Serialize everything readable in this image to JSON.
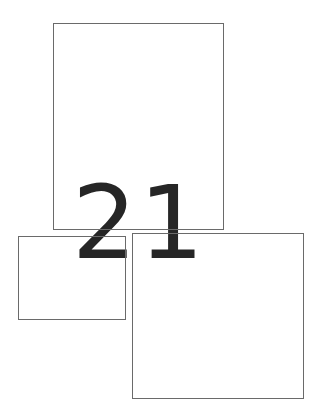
{
  "diagram": {
    "label": "21",
    "line_color": "#6a6a6a",
    "text_color": "#262626",
    "background": "#ffffff",
    "boxes": [
      {
        "id": "top-box",
        "x": 53,
        "y": 23,
        "width": 171,
        "height": 207
      },
      {
        "id": "bottom-left-box",
        "x": 18,
        "y": 236,
        "width": 108,
        "height": 84
      },
      {
        "id": "bottom-right-box",
        "x": 132,
        "y": 233,
        "width": 172,
        "height": 166
      }
    ]
  }
}
